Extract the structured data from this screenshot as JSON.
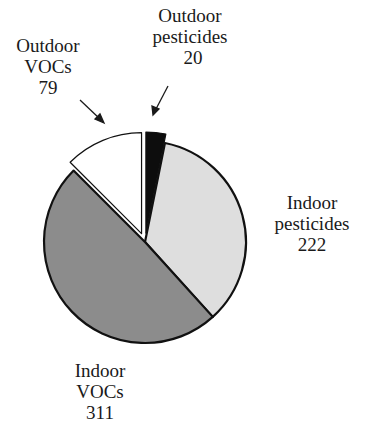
{
  "chart_data": {
    "type": "pie",
    "title": "",
    "start_angle_deg": 0,
    "direction": "clockwise",
    "total": 632,
    "slices": [
      {
        "name": "Outdoor pesticides",
        "label_lines": [
          "Outdoor",
          "pesticides"
        ],
        "value": 20,
        "color": "#0d0d0d",
        "exploded": true
      },
      {
        "name": "Indoor pesticides",
        "label_lines": [
          "Indoor",
          "pesticides"
        ],
        "value": 222,
        "color": "#dedede",
        "exploded": false
      },
      {
        "name": "Indoor VOCs",
        "label_lines": [
          "Indoor",
          "VOCs"
        ],
        "value": 311,
        "color": "#8c8c8c",
        "exploded": false
      },
      {
        "name": "Outdoor VOCs",
        "label_lines": [
          "Outdoor",
          "VOCs"
        ],
        "value": 79,
        "color": "#ffffff",
        "exploded": true
      }
    ]
  },
  "labels": {
    "outdoor_pesticides": {
      "line1": "Outdoor",
      "line2": "pesticides",
      "value": "20"
    },
    "indoor_pesticides": {
      "line1": "Indoor",
      "line2": "pesticides",
      "value": "222"
    },
    "indoor_vocs": {
      "line1": "Indoor",
      "line2": "VOCs",
      "value": "311"
    },
    "outdoor_vocs": {
      "line1": "Outdoor",
      "line2": "VOCs",
      "value": "79"
    }
  }
}
